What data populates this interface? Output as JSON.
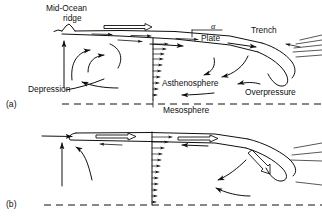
{
  "figure": {
    "background_color": "#ffffff",
    "line_color": "#101010",
    "width": 322,
    "height": 220
  },
  "panels": [
    {
      "id": "a",
      "label": "(a)",
      "labels": {
        "ridge_line1": "Mid-Ocean",
        "ridge_line2": "ridge",
        "angle": "α",
        "plate": "Plate",
        "trench": "Trench",
        "asthenosphere": "Asthenosphere",
        "depression": "Depression",
        "overpressure": "Overpressure",
        "mesosphere": "Mesosphere"
      }
    },
    {
      "id": "b",
      "label": "(b)",
      "labels": {}
    }
  ],
  "text_items": [
    {
      "name": "mid-ocean-ridge-label-line1",
      "text": "Mid-Ocean",
      "x": 46,
      "y": 11
    },
    {
      "name": "mid-ocean-ridge-label-line2",
      "text": "ridge",
      "x": 63,
      "y": 21
    },
    {
      "name": "angle-alpha-label",
      "text": "α",
      "x": 211,
      "y": 29
    },
    {
      "name": "plate-label",
      "text": "Plate",
      "x": 201,
      "y": 41
    },
    {
      "name": "trench-label",
      "text": "Trench",
      "x": 251,
      "y": 33
    },
    {
      "name": "asthenosphere-label",
      "text": "Asthenosphere",
      "x": 162,
      "y": 86
    },
    {
      "name": "depression-label",
      "text": "Depression",
      "x": 28,
      "y": 92
    },
    {
      "name": "overpressure-label",
      "text": "Overpressure",
      "x": 245,
      "y": 95
    },
    {
      "name": "mesosphere-label",
      "text": "Mesosphere",
      "x": 163,
      "y": 113
    },
    {
      "name": "panel-a-label",
      "text": "(a)",
      "x": 6,
      "y": 107
    },
    {
      "name": "panel-b-label",
      "text": "(b)",
      "x": 6,
      "y": 207
    }
  ],
  "colors": {
    "ink": "#101010",
    "paper": "#ffffff"
  }
}
